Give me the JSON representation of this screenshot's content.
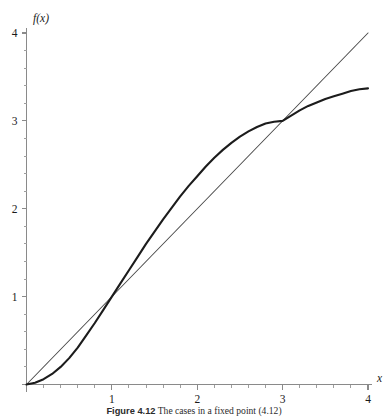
{
  "figure": {
    "caption_label": "Figure 4.12",
    "caption_text": "The cases in a fixed point (4.12)"
  },
  "chart_data": {
    "type": "line",
    "title": "",
    "xlabel": "x",
    "ylabel": "f(x)",
    "xlim": [
      0,
      4
    ],
    "ylim": [
      0,
      4
    ],
    "grid": false,
    "legend_position": "none",
    "x_ticks_major": [
      0,
      1,
      2,
      3,
      4
    ],
    "x_ticklabels": [
      "",
      "1",
      "2",
      "3",
      "4"
    ],
    "y_ticks_major": [
      0,
      1,
      2,
      3,
      4
    ],
    "y_ticklabels": [
      "",
      "1",
      "2",
      "3",
      "4"
    ],
    "x_minor_step": 0.2,
    "y_minor_step": 0.2,
    "series": [
      {
        "name": "f(x)",
        "style": "thick-solid",
        "color": "#1c1c1c",
        "x": [
          0,
          0.1,
          0.2,
          0.3,
          0.4,
          0.5,
          0.6,
          0.7,
          0.8,
          0.9,
          1,
          1.1,
          1.2,
          1.3,
          1.4,
          1.5,
          1.6,
          1.7,
          1.8,
          1.9,
          2,
          2.1,
          2.2,
          2.3,
          2.4,
          2.5,
          2.6,
          2.7,
          2.8,
          2.9,
          3,
          3.1,
          3.2,
          3.3,
          3.4,
          3.5,
          3.6,
          3.7,
          3.8,
          3.9,
          4
        ],
        "y": [
          0,
          0.02,
          0.06,
          0.12,
          0.2,
          0.3,
          0.42,
          0.56,
          0.7,
          0.85,
          1.0,
          1.15,
          1.3,
          1.45,
          1.6,
          1.74,
          1.88,
          2.01,
          2.14,
          2.26,
          2.37,
          2.48,
          2.58,
          2.67,
          2.75,
          2.82,
          2.88,
          2.93,
          2.97,
          2.99,
          3.0,
          3.06,
          3.12,
          3.17,
          3.21,
          3.25,
          3.28,
          3.31,
          3.34,
          3.36,
          3.37
        ]
      },
      {
        "name": "y = x",
        "style": "thin-solid",
        "color": "#4a4a4a",
        "x": [
          0,
          4
        ],
        "y": [
          0,
          4
        ]
      }
    ],
    "intersections": [
      {
        "x": 0,
        "y": 0
      },
      {
        "x": 1,
        "y": 1
      },
      {
        "x": 3,
        "y": 3
      }
    ]
  }
}
